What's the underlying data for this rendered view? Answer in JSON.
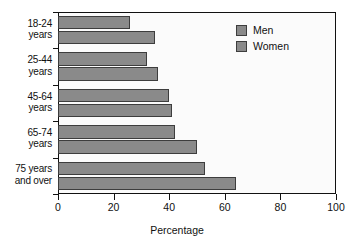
{
  "chart_data": {
    "type": "bar",
    "orientation": "horizontal",
    "title": "",
    "xlabel": "Percentage",
    "ylabel": "",
    "xlim": [
      0,
      100
    ],
    "xticks": [
      0,
      20,
      40,
      60,
      80,
      100
    ],
    "grid": false,
    "legend_position": "top-right",
    "categories": [
      "18-24\nyears",
      "25-44\nyears",
      "45-64\nyears",
      "65-74\nyears",
      "75 years\nand over"
    ],
    "category_lines": [
      [
        "18-24",
        "years"
      ],
      [
        "25-44",
        "years"
      ],
      [
        "45-64",
        "years"
      ],
      [
        "65-74",
        "years"
      ],
      [
        "75 years",
        "and over"
      ]
    ],
    "series": [
      {
        "name": "Men",
        "values": [
          26,
          32,
          40,
          42,
          53
        ]
      },
      {
        "name": "Women",
        "values": [
          35,
          36,
          41,
          50,
          64
        ]
      }
    ],
    "bar_color": "#8a8a8a",
    "bar_edge_color": "#3d3d3d",
    "axis_color": "#111111"
  },
  "legend": {
    "items": [
      {
        "label": "Men"
      },
      {
        "label": "Women"
      }
    ]
  },
  "axis": {
    "x_title": "Percentage",
    "x_tick_labels": [
      "0",
      "20",
      "40",
      "60",
      "80",
      "100"
    ]
  }
}
